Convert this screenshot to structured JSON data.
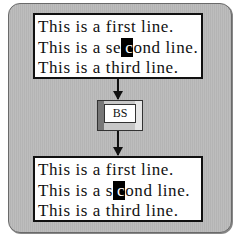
{
  "diagram": {
    "before": {
      "lines": [
        {
          "text": "This is a first line."
        },
        {
          "pre": "This is a se",
          "cursor": "c",
          "post": "ond line."
        },
        {
          "text": "This is a third line."
        }
      ]
    },
    "key": {
      "label": "BS"
    },
    "after": {
      "lines": [
        {
          "text": "This is a first line."
        },
        {
          "pre": "This is a s",
          "cursor": "c",
          "post": "ond line."
        },
        {
          "text": "This is a third line."
        }
      ]
    }
  }
}
